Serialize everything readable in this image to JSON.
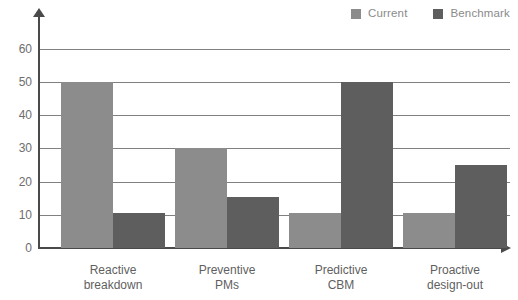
{
  "chart_data": {
    "type": "bar",
    "title": "",
    "subtitle": "",
    "xlabel": "",
    "ylabel": "",
    "categories": [
      "Reactive breakdown",
      "Preventive PMs",
      "Predictive CBM",
      "Proactive design-out"
    ],
    "category_lines": [
      [
        "Reactive",
        "breakdown"
      ],
      [
        "Preventive",
        "PMs"
      ],
      [
        "Predictive",
        "CBM"
      ],
      [
        "Proactive",
        "design-out"
      ]
    ],
    "series": [
      {
        "name": "Current",
        "color": "#8c8c8c",
        "values": [
          50,
          30,
          10.5,
          10.5
        ]
      },
      {
        "name": "Benchmark",
        "color": "#5e5e5e",
        "values": [
          10.5,
          15.5,
          50,
          25
        ]
      }
    ],
    "ylim": [
      0,
      62
    ],
    "yticks": [
      0,
      10,
      20,
      30,
      40,
      50,
      60
    ],
    "ytick_labels": [
      "0",
      "10",
      "20",
      "30",
      "40",
      "50",
      "60"
    ],
    "gridlines": [
      10,
      20,
      30,
      40,
      50,
      60
    ],
    "grid": true,
    "grid_color": "#808080",
    "legend_position": "top-right",
    "axis_color": "#4a4a4a",
    "background": "#ffffff"
  },
  "legend": {
    "items": [
      {
        "label": "Current",
        "swatch": "legend-swatch-current"
      },
      {
        "label": "Benchmark",
        "swatch": "legend-swatch-benchmark"
      }
    ]
  }
}
